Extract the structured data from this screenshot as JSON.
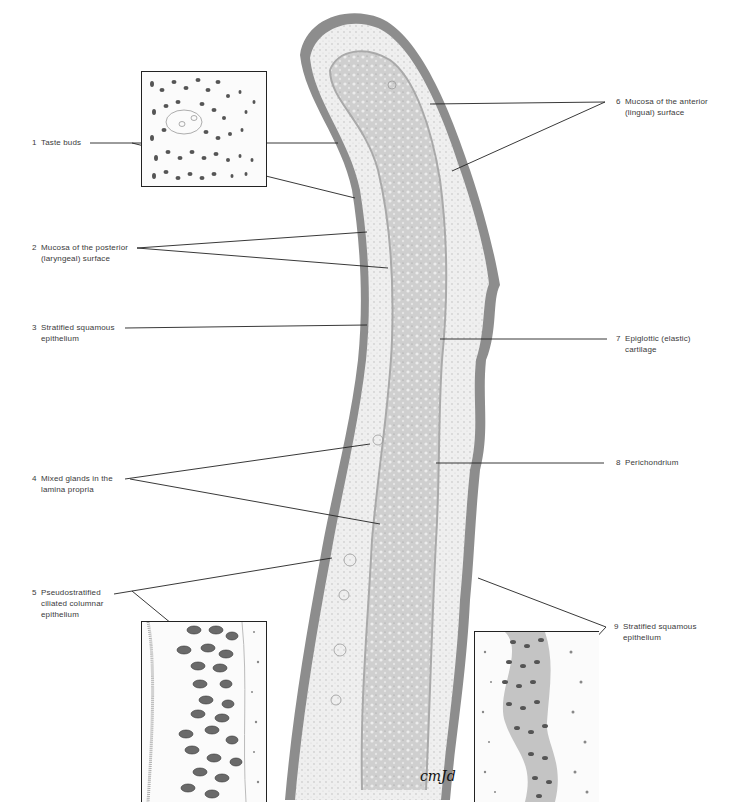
{
  "figure": {
    "type": "histology-illustration",
    "signature": "cmJd",
    "colors": {
      "background": "#ffffff",
      "epithelium": "#8a8a8a",
      "lamina_propria": "#ececec",
      "cartilage": "#c9c9c9",
      "leader_line": "#222222",
      "label_text": "#3a3a3a"
    }
  },
  "labels": {
    "left": [
      {
        "num": "1",
        "line1": "Taste buds",
        "line2": ""
      },
      {
        "num": "2",
        "line1": "Mucosa of the posterior",
        "line2": "(laryngeal) surface"
      },
      {
        "num": "3",
        "line1": "Stratified squamous",
        "line2": "epithelium"
      },
      {
        "num": "4",
        "line1": "Mixed glands in the",
        "line2": "lamina propria"
      },
      {
        "num": "5",
        "line1": "Pseudostratified",
        "line2": "ciliated columnar",
        "line3": "epithelium"
      }
    ],
    "right": [
      {
        "num": "6",
        "line1": "Mucosa of the anterior",
        "line2": "(lingual) surface"
      },
      {
        "num": "7",
        "line1": "Epiglottic (elastic)",
        "line2": "cartilage"
      },
      {
        "num": "8",
        "line1": "Perichondrium",
        "line2": ""
      },
      {
        "num": "9",
        "line1": "Stratified squamous",
        "line2": "epithelium"
      }
    ]
  },
  "insets": [
    {
      "id": "taste-bud-inset",
      "caption_ref": "1"
    },
    {
      "id": "pseudostratified-inset",
      "caption_ref": "5"
    },
    {
      "id": "stratified-squamous-inset",
      "caption_ref": "9"
    }
  ]
}
